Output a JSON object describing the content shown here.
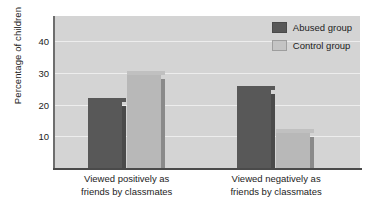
{
  "chart_data": {
    "type": "bar",
    "title": "",
    "xlabel": "",
    "ylabel": "Percentage of children",
    "categories": [
      "Viewed positively as friends by classmates",
      "Viewed negatively as friends by classmates"
    ],
    "category_lines": [
      [
        "Viewed positively as",
        "friends by classmates"
      ],
      [
        "Viewed negatively as",
        "friends by classmates"
      ]
    ],
    "series": [
      {
        "name": "Abused group",
        "color": "#585858",
        "values": [
          21,
          24.5
        ]
      },
      {
        "name": "Control group",
        "color": "#b8b8b8",
        "values": [
          29.5,
          11
        ]
      }
    ],
    "ylim": [
      0,
      48
    ],
    "yticks": [
      10,
      20,
      30,
      40
    ],
    "ytick_labels": [
      "10",
      "20",
      "30",
      "40"
    ],
    "grid": true,
    "legend_position": "top-right",
    "plot_background": "#d4d4d4",
    "figure_background": "#ffffff"
  },
  "legend": {
    "items": [
      {
        "label": "Abused group",
        "swatch": "dark"
      },
      {
        "label": "Control group",
        "swatch": "light"
      }
    ]
  },
  "axes": {
    "y_title": "Percentage of children",
    "tick_10": "10",
    "tick_20": "20",
    "tick_30": "30",
    "tick_40": "40"
  },
  "x_categories": [
    {
      "line1": "Viewed positively as",
      "line2": "friends by classmates"
    },
    {
      "line1": "Viewed negatively as",
      "line2": "friends by classmates"
    }
  ]
}
